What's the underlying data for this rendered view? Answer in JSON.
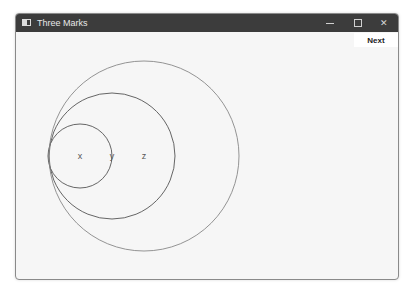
{
  "window": {
    "title": "Three Marks",
    "controls": {
      "minimize": "minimize",
      "maximize": "maximize",
      "close": "close"
    }
  },
  "toolbar": {
    "next_label": "Next"
  },
  "canvas": {
    "circles": [
      {
        "name": "circle-x",
        "cx": 79,
        "cy": 155,
        "r": 32,
        "stroke": "#555555"
      },
      {
        "name": "circle-y",
        "cx": 111,
        "cy": 155,
        "r": 63,
        "stroke": "#555555"
      },
      {
        "name": "circle-z",
        "cx": 143,
        "cy": 155,
        "r": 95,
        "stroke": "#888888"
      }
    ],
    "marks": [
      {
        "label": "x",
        "x": 79,
        "y": 155
      },
      {
        "label": "y",
        "x": 111,
        "y": 155
      },
      {
        "label": "z",
        "x": 143,
        "y": 155
      }
    ]
  }
}
